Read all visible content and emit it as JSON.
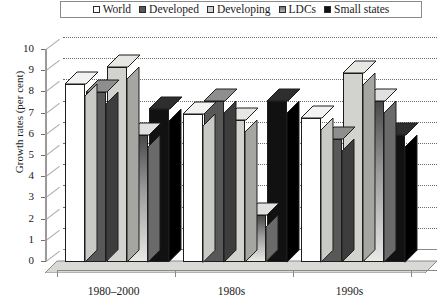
{
  "legend": {
    "items": [
      {
        "label": "World",
        "swatch": "white-square-icon",
        "color": "#ffffff"
      },
      {
        "label": "Developed",
        "swatch": "dark-gray-square-icon",
        "color": "#585858"
      },
      {
        "label": "Developing",
        "swatch": "light-gray-square-icon",
        "color": "#d2d2ce"
      },
      {
        "label": "LDCs",
        "swatch": "mid-gray-square-icon",
        "color": "#8d8d8d"
      },
      {
        "label": "Small states",
        "swatch": "black-square-icon",
        "color": "#111111"
      }
    ]
  },
  "chart_data": {
    "type": "bar",
    "title": "",
    "xlabel": "",
    "ylabel": "Growth rates (per cent)",
    "categories": [
      "1980–2000",
      "1980s",
      "1990s"
    ],
    "series": [
      {
        "name": "World",
        "values": [
          8.4,
          7.0,
          6.8
        ],
        "color": "#ffffff"
      },
      {
        "name": "Developed",
        "values": [
          8.0,
          7.6,
          5.8
        ],
        "color": "#585858"
      },
      {
        "name": "Developing",
        "values": [
          9.2,
          6.7,
          8.9
        ],
        "color": "#d2d2ce"
      },
      {
        "name": "LDCs",
        "values": [
          6.0,
          2.2,
          7.6
        ],
        "color": "#9a9a9a"
      },
      {
        "name": "Small states",
        "values": [
          7.2,
          7.6,
          6.0
        ],
        "color": "#111111"
      }
    ],
    "ylim": [
      0,
      10
    ],
    "yticks": [
      "10",
      "9",
      "8",
      "7",
      "6",
      "5",
      "4",
      "3",
      "2",
      "1",
      "0"
    ],
    "grid": true,
    "legend_position": "top"
  }
}
